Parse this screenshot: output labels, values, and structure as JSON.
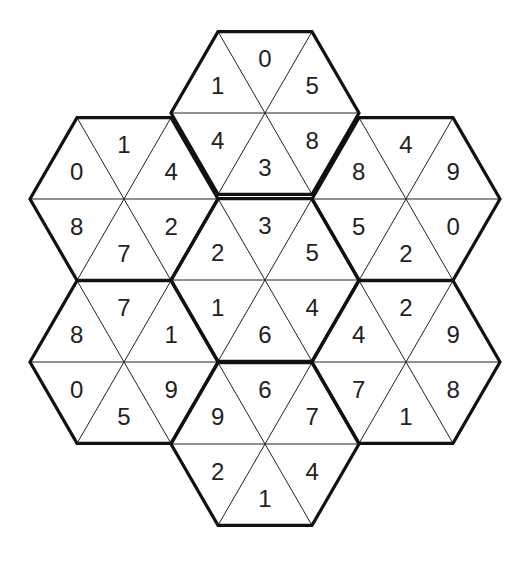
{
  "puzzle": {
    "type": "hexagonal-triangle-number-puzzle",
    "hexagons": [
      {
        "id": "top",
        "center": [
          265,
          113
        ],
        "cells": {
          "top": "0",
          "upper_right": "5",
          "lower_right": "8",
          "bottom": "3",
          "lower_left": "4",
          "upper_left": "1"
        }
      },
      {
        "id": "upper-left",
        "center": [
          124,
          199
        ],
        "cells": {
          "top": "1",
          "upper_right": "4",
          "lower_right": "2",
          "bottom": "7",
          "lower_left": "8",
          "upper_left": "0"
        }
      },
      {
        "id": "upper-right",
        "center": [
          406,
          199
        ],
        "cells": {
          "top": "4",
          "upper_right": "9",
          "lower_right": "0",
          "bottom": "2",
          "lower_left": "5",
          "upper_left": "8"
        }
      },
      {
        "id": "middle",
        "center": [
          265,
          280
        ],
        "cells": {
          "top": "3",
          "upper_right": "5",
          "lower_right": "4",
          "bottom": "6",
          "lower_left": "1",
          "upper_left": "2"
        }
      },
      {
        "id": "lower-left",
        "center": [
          124,
          362
        ],
        "cells": {
          "top": "7",
          "upper_right": "1",
          "lower_right": "9",
          "bottom": "5",
          "lower_left": "0",
          "upper_left": "8"
        }
      },
      {
        "id": "lower-right",
        "center": [
          406,
          362
        ],
        "cells": {
          "top": "2",
          "upper_right": "9",
          "lower_right": "8",
          "bottom": "1",
          "lower_left": "7",
          "upper_left": "4"
        }
      },
      {
        "id": "bottom",
        "center": [
          265,
          444
        ],
        "cells": {
          "top": "6",
          "upper_right": "7",
          "lower_right": "4",
          "bottom": "1",
          "lower_left": "2",
          "upper_left": "9"
        }
      }
    ],
    "colors": {
      "line": "#111111",
      "text": "#222222",
      "background": "#ffffff"
    }
  }
}
